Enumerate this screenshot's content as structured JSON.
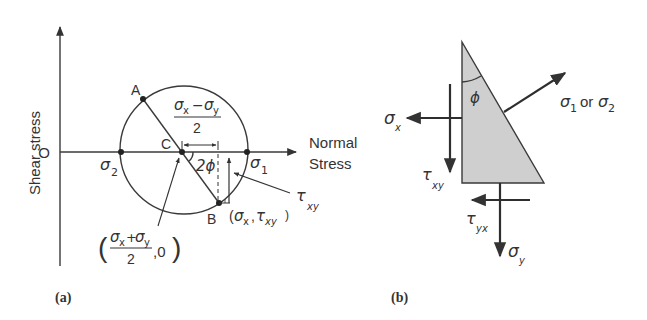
{
  "figure": {
    "panel_a": {
      "caption": "(a)",
      "y_axis_label": "Shear stress",
      "x_axis_label_line1": "Normal",
      "x_axis_label_line2": "Stress",
      "origin_label": "O",
      "point_A": "A",
      "point_B": "B",
      "point_C": "C",
      "sigma": "σ",
      "tau": "τ",
      "phi": "ϕ",
      "sub_1": "1",
      "sub_2": "2",
      "sub_x": "x",
      "sub_y": "y",
      "sub_xy": "xy",
      "two": "2",
      "angle_label": "2ϕ",
      "minus": "−",
      "plus": "+",
      "center_coord_tail": ",0",
      "paren_open": "(",
      "paren_close": ")",
      "b_coord_open": "(",
      "b_coord_comma": ",",
      "b_coord_close": ")"
    },
    "panel_b": {
      "caption": "(b)",
      "phi": "ϕ",
      "sigma": "σ",
      "tau": "τ",
      "sub_x": "x",
      "sub_y": "y",
      "sub_xy": "xy",
      "sub_yx": "yx",
      "sub_1": "1",
      "sub_2": "2",
      "or_text": "or"
    },
    "colors": {
      "ink": "#333333",
      "triangle_fill": "#cfcfcf",
      "background": "#ffffff"
    }
  }
}
